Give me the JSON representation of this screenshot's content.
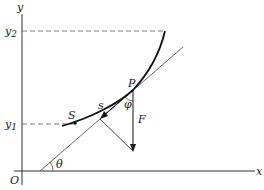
{
  "figure": {
    "axes": {
      "x_label": "x",
      "y_label": "y",
      "origin_label": "O"
    },
    "ticks": {
      "y1": "y",
      "y1_sub": "1",
      "y2": "y",
      "y2_sub": "2"
    },
    "points": {
      "P": "P",
      "S": "S"
    },
    "labels": {
      "arc_length": "s",
      "force": "F",
      "angle_phi": "φ",
      "angle_theta": "θ"
    },
    "colors": {
      "ink": "#1a1a1a",
      "dashed": "#555555",
      "background": "#ffffff"
    }
  }
}
